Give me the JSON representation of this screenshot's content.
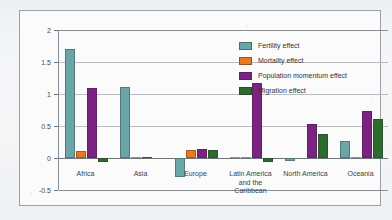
{
  "chart_data": {
    "type": "bar",
    "title": "",
    "xlabel": "",
    "ylabel": "",
    "ylim": [
      -0.5,
      2
    ],
    "ytick_labels": [
      "2",
      "1.5",
      "1",
      "0.5",
      "0",
      "-0.5"
    ],
    "ytick_values": [
      2,
      1.5,
      1,
      0.5,
      0,
      -0.5
    ],
    "grid": true,
    "legend_position": "top-right",
    "categories": [
      "Africa",
      "Asia",
      "Europe",
      "Latin America and the Caribbean",
      "North America",
      "Oceania"
    ],
    "category_label_lines": [
      [
        "Africa"
      ],
      [
        "Asia"
      ],
      [
        "Europe"
      ],
      [
        "Latin America",
        "and the",
        "Caribbean"
      ],
      [
        "North America"
      ],
      [
        "Oceania"
      ]
    ],
    "series": [
      {
        "name": "Fertility effect",
        "color": "#6aa5a8",
        "values": [
          1.7,
          1.11,
          -0.3,
          0.01,
          -0.04,
          0.27
        ]
      },
      {
        "name": "Mortality effect",
        "color": "#e8791e",
        "values": [
          0.11,
          0.01,
          0.13,
          0.01,
          0.0,
          0.01
        ]
      },
      {
        "name": "Population momentum effect",
        "color": "#7b2382",
        "values": [
          1.09,
          0.01,
          0.14,
          1.17,
          0.53,
          0.74
        ]
      },
      {
        "name": "Migration effect",
        "color": "#2e6b2e",
        "values": [
          -0.07,
          0.0,
          0.13,
          -0.07,
          0.38,
          0.61
        ]
      }
    ]
  },
  "legend": {
    "items": [
      {
        "label": "Fertility effect",
        "color": "#6aa5a8"
      },
      {
        "label": "Mortality effect",
        "color": "#e8791e"
      },
      {
        "label": "Population momentum effect",
        "color": "#7b2382"
      },
      {
        "label": "Migration effect",
        "color": "#2e6b2e"
      }
    ]
  },
  "background": {
    "ghost_text": "Components of Population Growth"
  }
}
